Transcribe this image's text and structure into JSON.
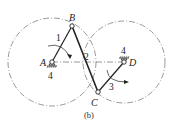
{
  "caption": "(b)",
  "joints": {
    "A": {
      "label": "A",
      "x": 52,
      "y": 62
    },
    "B": {
      "label": "B",
      "x": 72,
      "y": 26
    },
    "C": {
      "label": "C",
      "x": 98,
      "y": 92
    },
    "D": {
      "label": "D",
      "x": 124,
      "y": 62
    }
  },
  "links": {
    "link1": {
      "label": "1",
      "from": "A",
      "to": "B"
    },
    "link2": {
      "label": "2",
      "from": "B",
      "to": "C"
    },
    "link3": {
      "label": "3",
      "from": "C",
      "to": "D"
    },
    "ground_A": {
      "label": "4"
    },
    "ground_D": {
      "label": "4"
    }
  },
  "circles": {
    "left": {
      "center": "A",
      "radius": 44
    },
    "right": {
      "center": "D",
      "radius": 41
    }
  },
  "colors": {
    "stroke": "#222222",
    "construction": "#555555",
    "background": "#ffffff"
  }
}
